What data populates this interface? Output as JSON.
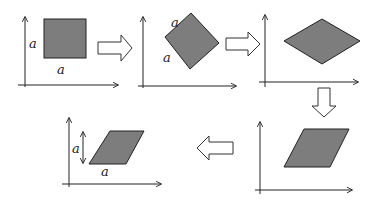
{
  "diagram": {
    "colors": {
      "shape_fill": "#7d7d7d",
      "stroke": "#222222",
      "arrow_fill": "#ffffff"
    },
    "panels": [
      {
        "id": 1,
        "shape": "square",
        "labels": [
          "a",
          "a"
        ]
      },
      {
        "id": 2,
        "shape": "rotated-square",
        "labels": [
          "a",
          "a"
        ]
      },
      {
        "id": 3,
        "shape": "rhombus",
        "labels": []
      },
      {
        "id": 4,
        "shape": "parallelogram",
        "labels": []
      },
      {
        "id": 5,
        "shape": "parallelogram",
        "labels": [
          "a",
          "a"
        ],
        "has_height_marker": true
      }
    ],
    "flow_arrows": [
      {
        "from": 1,
        "to": 2,
        "direction": "right"
      },
      {
        "from": 2,
        "to": 3,
        "direction": "right"
      },
      {
        "from": 3,
        "to": 4,
        "direction": "down"
      },
      {
        "from": 4,
        "to": 5,
        "direction": "left"
      }
    ]
  }
}
